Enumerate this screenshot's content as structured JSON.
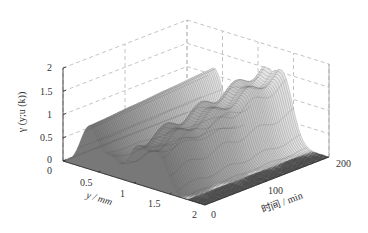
{
  "chart_data": {
    "type": "surface3d",
    "title": "",
    "axes": {
      "z": {
        "label": "γ (y;u (k))",
        "ticks": [
          "0",
          "0.5",
          "1",
          "1.5",
          "2"
        ],
        "range": [
          0,
          2
        ]
      },
      "y": {
        "label": "y / mm",
        "ticks": [
          "0",
          "0.5",
          "1",
          "1.5",
          "2"
        ],
        "range": [
          0,
          2
        ]
      },
      "t": {
        "label": "时间 / min",
        "ticks": [
          "0",
          "100",
          "200"
        ],
        "range": [
          0,
          200
        ]
      }
    },
    "grid": true,
    "grid_style": "dashed",
    "colormap": "gray",
    "surface_description": "Particle size distribution over time: multimodal ridges along y; peaks near y≈0.4 (≈1.1), y≈1.2–1.4 (≈1.3–1.5) and later times growing, decaying to 0 near y=2",
    "peaks": [
      {
        "y": 0.4,
        "z": 1.1
      },
      {
        "y": 1.3,
        "z": 1.5
      }
    ]
  },
  "labels": {
    "z_axis": "γ (y;u (k))",
    "y_axis": "y / mm",
    "t_axis": "时间 / min",
    "z_ticks": [
      "0",
      "0.5",
      "1",
      "1.5",
      "2"
    ],
    "y_ticks": [
      "0",
      "0.5",
      "1",
      "1.5",
      "2"
    ],
    "t_ticks": [
      "0",
      "100",
      "200"
    ]
  }
}
